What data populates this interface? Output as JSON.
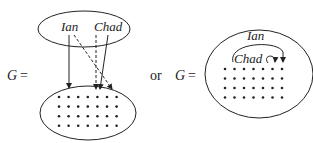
{
  "diagram1": {
    "lhs_var": "G",
    "equals": "=",
    "nodes": [
      "Ian",
      "Chad"
    ],
    "target_dots": {
      "rows": 4,
      "cols": 7
    }
  },
  "connector": "or",
  "diagram2": {
    "lhs_var": "G",
    "equals": "=",
    "nodes": [
      "Ian",
      "Chad"
    ],
    "dots": {
      "rows": 4,
      "cols": 7
    }
  },
  "colors": {
    "stroke": "#222222",
    "background": "#ffffff"
  }
}
